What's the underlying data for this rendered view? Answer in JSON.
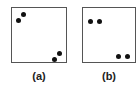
{
  "panels": [
    {
      "label": "(a)",
      "points": [
        [
          6,
          12
        ],
        [
          11,
          6
        ],
        [
          42,
          51
        ],
        [
          47,
          45
        ]
      ]
    },
    {
      "label": "(b)",
      "points": [
        [
          7,
          13
        ],
        [
          16,
          13
        ],
        [
          35,
          48
        ],
        [
          44,
          48
        ]
      ]
    }
  ]
}
